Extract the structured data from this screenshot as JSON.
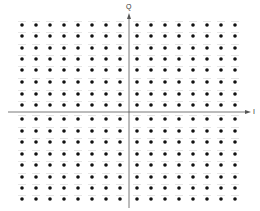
{
  "diagram": {
    "title": "",
    "type": "constellation",
    "modulation_grid": "16x16 square constellation",
    "axes": {
      "horizontal": {
        "label": "I",
        "y": 112,
        "x_start": 8,
        "x_end": 251
      },
      "vertical": {
        "label": "Q",
        "x": 129,
        "y_start": 13,
        "y_end": 208
      }
    },
    "points": {
      "columns_x": [
        22,
        36,
        50,
        64,
        78,
        92,
        106,
        120,
        137,
        151,
        165,
        179,
        193,
        207,
        221,
        235
      ],
      "rows_y": [
        25,
        36,
        48,
        59,
        70,
        82,
        94,
        105,
        119,
        131,
        142,
        154,
        165,
        177,
        188,
        199
      ],
      "count": 256,
      "dot_color": "#111111",
      "dot_radius": 1.8,
      "tick_color": "#d4d4d4"
    },
    "colors": {
      "axis": "#555555",
      "background": "#ffffff"
    }
  }
}
